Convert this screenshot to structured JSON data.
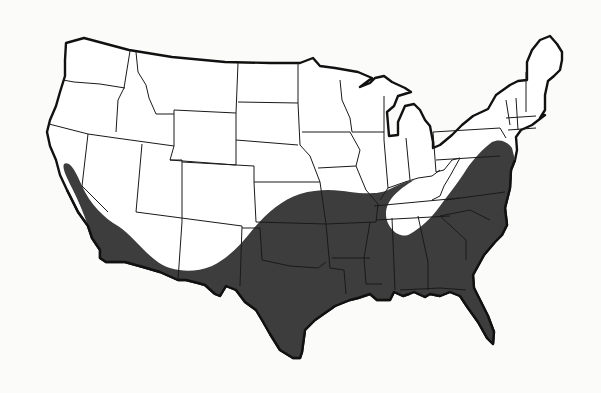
{
  "map": {
    "subject": "Contiguous United States",
    "style": "black-and-white outline map with state borders",
    "labels_visible": false,
    "legend_visible": false,
    "colors": {
      "background": "#fbfbfa",
      "land": "#ffffff",
      "shaded_region": "#3d3d3d",
      "borders": "#111111"
    },
    "shaded_region": {
      "description": "Dark shaded distribution area across the southern United States",
      "covers": [
        "Central and southern California",
        "Arizona (southern/western)",
        "New Mexico (southern)",
        "Texas",
        "Oklahoma",
        "Kansas (southern edge)",
        "Missouri (southern)",
        "Arkansas",
        "Louisiana",
        "Mississippi",
        "Alabama",
        "Georgia",
        "Florida",
        "Tennessee (western and southern)",
        "South Carolina",
        "North Carolina",
        "Virginia (eastern)",
        "Maryland",
        "Delaware",
        "New Jersey",
        "Southeastern Pennsylvania"
      ],
      "excluded_pocket": "Unshaded area over Kentucky, eastern Tennessee, and West Virginia"
    }
  }
}
